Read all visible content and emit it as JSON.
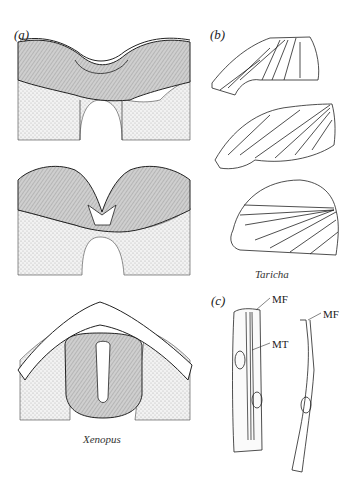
{
  "figure": {
    "panels": [
      {
        "id": "a",
        "label": "(a)",
        "species": "Xenopus",
        "drawings": 3
      },
      {
        "id": "b",
        "label": "(b)",
        "species": "Taricha",
        "drawings": 3
      },
      {
        "id": "c",
        "label": "(c)",
        "annotations": [
          "MF",
          "MT",
          "MF"
        ]
      }
    ]
  },
  "panel_a": {
    "label": "(a)",
    "caption": "Xenopus"
  },
  "panel_b": {
    "label": "(b)",
    "caption": "Taricha"
  },
  "panel_c": {
    "label": "(c)",
    "mf_left": "MF",
    "mt": "MT",
    "mf_right": "MF"
  }
}
